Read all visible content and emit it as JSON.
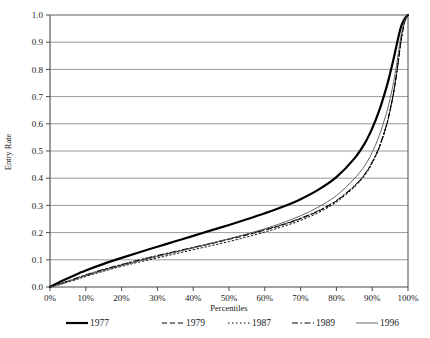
{
  "chart_data": {
    "type": "line",
    "title": "",
    "xlabel": "Percentiles",
    "ylabel": "Entry Rate",
    "xlim": [
      0,
      100
    ],
    "ylim": [
      0,
      1.0
    ],
    "grid": "horizontal",
    "legend_position": "bottom",
    "x_tick_labels": [
      "0%",
      "10%",
      "20%",
      "30%",
      "40%",
      "50%",
      "60%",
      "70%",
      "80%",
      "90%",
      "100%"
    ],
    "x_tick_values": [
      0,
      10,
      20,
      30,
      40,
      50,
      60,
      70,
      80,
      90,
      100
    ],
    "y_tick_labels": [
      "0.0",
      "0.1",
      "0.2",
      "0.3",
      "0.4",
      "0.5",
      "0.6",
      "0.7",
      "0.8",
      "0.9",
      "1.0"
    ],
    "y_tick_values": [
      0.0,
      0.1,
      0.2,
      0.3,
      0.4,
      0.5,
      0.6,
      0.7,
      0.8,
      0.9,
      1.0
    ],
    "x": [
      0,
      3,
      5,
      8,
      10,
      15,
      20,
      25,
      30,
      35,
      40,
      45,
      50,
      55,
      60,
      65,
      70,
      75,
      80,
      85,
      88,
      90,
      92,
      94,
      95,
      96,
      97,
      98,
      99,
      100
    ],
    "series": [
      {
        "name": "1977",
        "style": "solid-thick",
        "color": "#000000",
        "width": 2.2,
        "dash": "none",
        "values": [
          0.0,
          0.02,
          0.032,
          0.05,
          0.061,
          0.085,
          0.107,
          0.128,
          0.148,
          0.168,
          0.188,
          0.208,
          0.228,
          0.249,
          0.271,
          0.295,
          0.323,
          0.358,
          0.404,
          0.472,
          0.53,
          0.583,
          0.65,
          0.735,
          0.785,
          0.84,
          0.9,
          0.955,
          0.985,
          1.0
        ]
      },
      {
        "name": "1979",
        "style": "dashed",
        "color": "#000000",
        "width": 1.0,
        "dash": "5,3",
        "values": [
          0.0,
          0.012,
          0.021,
          0.034,
          0.043,
          0.063,
          0.081,
          0.098,
          0.114,
          0.129,
          0.144,
          0.159,
          0.175,
          0.191,
          0.209,
          0.228,
          0.251,
          0.279,
          0.316,
          0.37,
          0.415,
          0.458,
          0.515,
          0.595,
          0.65,
          0.715,
          0.8,
          0.9,
          0.97,
          1.0
        ]
      },
      {
        "name": "1987",
        "style": "dotted",
        "color": "#000000",
        "width": 1.0,
        "dash": "1.5,2.5",
        "values": [
          0.0,
          0.01,
          0.018,
          0.03,
          0.039,
          0.058,
          0.076,
          0.092,
          0.107,
          0.122,
          0.137,
          0.152,
          0.167,
          0.184,
          0.202,
          0.222,
          0.245,
          0.274,
          0.312,
          0.367,
          0.412,
          0.455,
          0.512,
          0.592,
          0.648,
          0.715,
          0.8,
          0.9,
          0.972,
          1.0
        ]
      },
      {
        "name": "1989",
        "style": "dash-dot",
        "color": "#000000",
        "width": 1.0,
        "dash": "6,2.5,1.5,2.5",
        "values": [
          0.0,
          0.013,
          0.022,
          0.036,
          0.045,
          0.065,
          0.083,
          0.1,
          0.116,
          0.131,
          0.146,
          0.161,
          0.177,
          0.193,
          0.211,
          0.23,
          0.253,
          0.281,
          0.318,
          0.372,
          0.417,
          0.46,
          0.517,
          0.597,
          0.652,
          0.718,
          0.802,
          0.902,
          0.972,
          1.0
        ]
      },
      {
        "name": "1996",
        "style": "solid-thin",
        "color": "#555555",
        "width": 0.9,
        "dash": "none",
        "values": [
          0.0,
          0.011,
          0.019,
          0.032,
          0.041,
          0.061,
          0.079,
          0.096,
          0.112,
          0.128,
          0.144,
          0.16,
          0.177,
          0.195,
          0.214,
          0.236,
          0.262,
          0.294,
          0.336,
          0.398,
          0.448,
          0.495,
          0.558,
          0.64,
          0.693,
          0.755,
          0.833,
          0.92,
          0.978,
          1.0
        ]
      }
    ]
  },
  "legend": {
    "entries": [
      {
        "label": "1977"
      },
      {
        "label": "1979"
      },
      {
        "label": "1987"
      },
      {
        "label": "1989"
      },
      {
        "label": "1996"
      }
    ]
  },
  "colors": {
    "axis": "#4a4a4a",
    "grid": "#808080",
    "line": "#000000",
    "thin_line": "#555555",
    "background": "#ffffff"
  }
}
